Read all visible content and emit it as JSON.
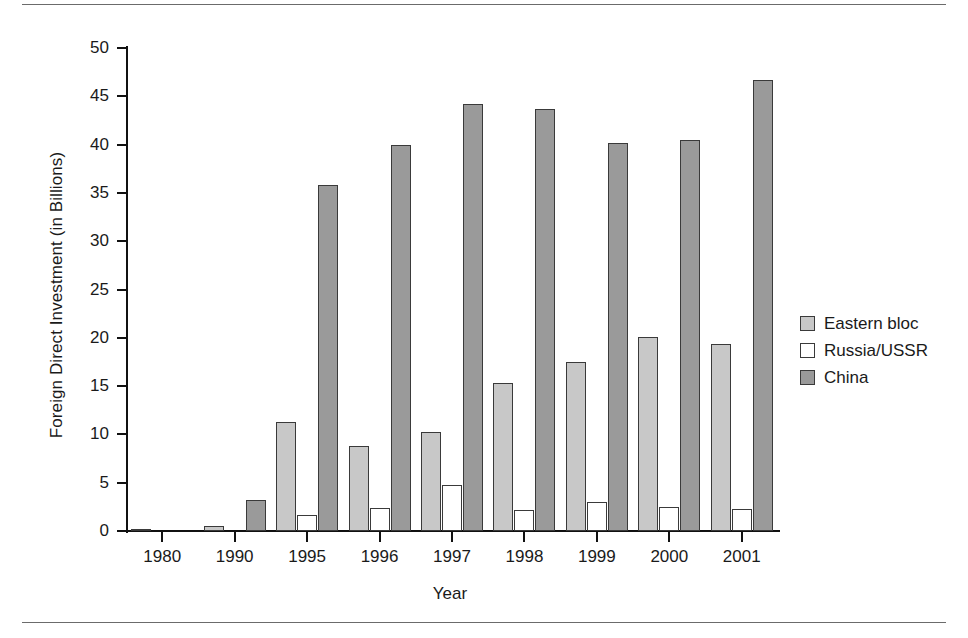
{
  "chart_data": {
    "type": "bar",
    "title": "",
    "xlabel": "Year",
    "ylabel": "Foreign Direct Investment (in Billions)",
    "categories": [
      "1980",
      "1990",
      "1995",
      "1996",
      "1997",
      "1998",
      "1999",
      "2000",
      "2001"
    ],
    "series": [
      {
        "name": "Eastern bloc",
        "color": "#c8c8c8",
        "values": [
          0.1,
          0.5,
          11.3,
          8.8,
          10.3,
          15.3,
          17.5,
          20.1,
          19.4
        ]
      },
      {
        "name": "Russia/USSR",
        "color": "#ffffff",
        "values": [
          0.0,
          0.0,
          1.7,
          2.4,
          4.8,
          2.2,
          3.0,
          2.5,
          2.3
        ]
      },
      {
        "name": "China",
        "color": "#9a9a9a",
        "values": [
          0.0,
          3.2,
          35.8,
          40.0,
          44.2,
          43.7,
          40.2,
          40.5,
          46.7
        ]
      }
    ],
    "ylim": [
      0,
      50
    ],
    "yticks": [
      0,
      5,
      10,
      15,
      20,
      25,
      30,
      35,
      40,
      45,
      50
    ],
    "ytick_labels": [
      "0",
      "5",
      "10",
      "15",
      "20",
      "25",
      "30",
      "35",
      "40",
      "45",
      "50"
    ],
    "grid": false,
    "legend_position": "right"
  },
  "legend": {
    "items": [
      {
        "label": "Eastern bloc"
      },
      {
        "label": "Russia/USSR"
      },
      {
        "label": "China"
      }
    ]
  }
}
